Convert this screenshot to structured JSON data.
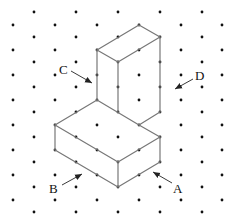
{
  "diagram": {
    "type": "isometric-dot-grid",
    "grid": {
      "dot_color": "#111111",
      "dot_radius": 1.4,
      "offset_rows": {
        "xs": [
          34,
          76,
          118,
          160,
          202
        ],
        "ys": [
          12,
          37,
          62,
          87,
          112,
          137,
          162,
          187,
          212
        ]
      },
      "even_rows": {
        "xs": [
          13,
          55,
          97,
          139,
          181,
          222
        ],
        "ys": [
          25,
          50,
          75,
          100,
          125,
          150,
          175,
          200
        ]
      }
    },
    "edge_color": "#777777",
    "edges": [
      [
        139,
        25,
        160,
        37
      ],
      [
        139,
        25,
        97,
        50
      ],
      [
        97,
        50,
        118,
        62
      ],
      [
        118,
        62,
        160,
        37
      ],
      [
        97,
        50,
        97,
        100
      ],
      [
        118,
        62,
        118,
        112
      ],
      [
        160,
        37,
        160,
        112
      ],
      [
        97,
        100,
        55,
        125
      ],
      [
        97,
        100,
        139,
        125
      ],
      [
        139,
        125,
        160,
        112
      ],
      [
        139,
        125,
        160,
        137
      ],
      [
        55,
        125,
        118,
        162
      ],
      [
        118,
        162,
        160,
        137
      ],
      [
        55,
        125,
        55,
        150
      ],
      [
        55,
        150,
        118,
        187
      ],
      [
        118,
        162,
        118,
        187
      ],
      [
        118,
        187,
        160,
        162
      ],
      [
        160,
        137,
        160,
        162
      ]
    ],
    "labels": [
      {
        "text": "C",
        "x": 59,
        "y": 74,
        "arrow": [
          71,
          71,
          92,
          83
        ]
      },
      {
        "text": "D",
        "x": 195,
        "y": 80,
        "arrow": [
          193,
          79,
          175,
          89
        ]
      },
      {
        "text": "B",
        "x": 49,
        "y": 193,
        "arrow": [
          62,
          185,
          82,
          174
        ]
      },
      {
        "text": "A",
        "x": 173,
        "y": 193,
        "arrow": [
          172,
          183,
          153,
          172
        ]
      }
    ]
  }
}
